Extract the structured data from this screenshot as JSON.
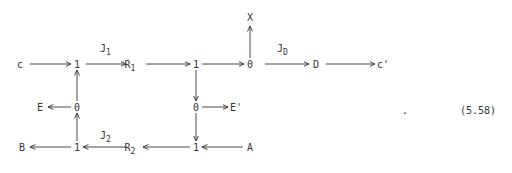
{
  "diagram": {
    "type": "bond-graph",
    "equation_number": "(5.58)",
    "trailing_punct": ".",
    "nodes": {
      "c": {
        "label": "c",
        "x": 20,
        "y": 64
      },
      "j1a": {
        "label": "1",
        "x": 77,
        "y": 64
      },
      "R1": {
        "label": "R",
        "sub": "1",
        "x": 132,
        "y": 64
      },
      "j1b": {
        "label": "1",
        "x": 196,
        "y": 64
      },
      "j0a": {
        "label": "0",
        "x": 250,
        "y": 64
      },
      "X": {
        "label": "X",
        "x": 250,
        "y": 17
      },
      "D": {
        "label": "D",
        "x": 316,
        "y": 64
      },
      "cp": {
        "label": "c'",
        "x": 381,
        "y": 64
      },
      "E": {
        "label": "E",
        "x": 40,
        "y": 107
      },
      "j0b": {
        "label": "0",
        "x": 77,
        "y": 107
      },
      "j0c": {
        "label": "0",
        "x": 196,
        "y": 107
      },
      "Ep": {
        "label": "E'",
        "x": 234,
        "y": 107
      },
      "B": {
        "label": "B",
        "x": 22,
        "y": 147
      },
      "j1c": {
        "label": "1",
        "x": 77,
        "y": 147
      },
      "R2": {
        "label": "R",
        "sub": "2",
        "x": 132,
        "y": 147
      },
      "j1d": {
        "label": "1",
        "x": 196,
        "y": 147
      },
      "A": {
        "label": "A",
        "x": 250,
        "y": 147
      }
    },
    "bond_labels": {
      "J1": {
        "label": "J",
        "sub": "1"
      },
      "JD": {
        "label": "J",
        "sub": "D"
      },
      "J2": {
        "label": "J",
        "sub": "2"
      }
    },
    "edges": [
      {
        "from": "c",
        "to": "1 (top-left)"
      },
      {
        "from": "1 (top-left)",
        "to": "R1",
        "label": "J1"
      },
      {
        "from": "R1",
        "to": "1 (top-mid)"
      },
      {
        "from": "1 (top-mid)",
        "to": "0 (top-right)"
      },
      {
        "from": "0 (top-right)",
        "to": "X"
      },
      {
        "from": "0 (top-right)",
        "to": "D",
        "label": "JD"
      },
      {
        "from": "D",
        "to": "c'"
      },
      {
        "from": "1 (top-mid)",
        "to": "0 (mid-right)"
      },
      {
        "from": "0 (mid-right)",
        "to": "E'"
      },
      {
        "from": "0 (mid-right)",
        "to": "1 (bottom-mid)"
      },
      {
        "from": "A",
        "to": "1 (bottom-mid)"
      },
      {
        "from": "1 (bottom-mid)",
        "to": "R2"
      },
      {
        "from": "R2",
        "to": "1 (bottom-left)",
        "label": "J2"
      },
      {
        "from": "1 (bottom-left)",
        "to": "B"
      },
      {
        "from": "1 (bottom-left)",
        "to": "0 (mid-left)"
      },
      {
        "from": "0 (mid-left)",
        "to": "E"
      },
      {
        "from": "0 (mid-left)",
        "to": "1 (top-left)"
      }
    ]
  }
}
